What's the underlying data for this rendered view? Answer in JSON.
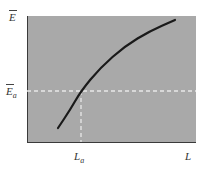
{
  "chart_data": {
    "type": "line",
    "title": "",
    "xlabel": "L",
    "ylabel": "Ē",
    "x_tick_labels": [
      "L_a"
    ],
    "y_tick_labels": [
      "Ē_a"
    ],
    "grid": false,
    "legend": null,
    "background": "#a9a9a9",
    "series": [
      {
        "name": "Ē(L)",
        "description": "concave increasing curve",
        "color": "#1a1a1a",
        "points_px": [
          [
            58,
            128
          ],
          [
            70,
            110
          ],
          [
            81,
            91
          ],
          [
            100,
            68
          ],
          [
            125,
            46
          ],
          [
            150,
            31
          ],
          [
            175,
            20
          ]
        ]
      }
    ],
    "reference_lines": [
      {
        "type": "horizontal",
        "label": "Ē_a",
        "y_px": 91,
        "style": "dashed",
        "color": "#e8e8e8"
      },
      {
        "type": "vertical",
        "label": "L_a",
        "x_px": 81,
        "style": "dashed",
        "color": "#e8e8e8"
      }
    ]
  },
  "labels": {
    "y_axis_top": "E",
    "y_axis_marker": "E",
    "y_axis_marker_sub": "a",
    "x_marker": "L",
    "x_marker_sub": "a",
    "x_axis_end": "L"
  }
}
